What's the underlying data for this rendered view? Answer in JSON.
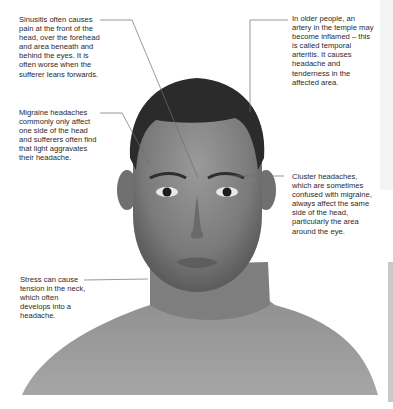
{
  "figure": {
    "colors": {
      "background": "#ffffff",
      "text": "#2a2a2a",
      "leader_line": "#6e6e6e",
      "skin_mid": "#8a8a8a",
      "hair": "#2b2b2b"
    }
  },
  "annotations": [
    {
      "id": "sinusitis",
      "text": "Sinusitis often causes pain at the front of the head, over the forehead and area beneath and behind the eyes. It is often worse when the sufferer leans forwards."
    },
    {
      "id": "temporal-arteritis",
      "text": "In older people, an artery in the temple may become inflamed – this is called temporal arteritis. It causes headache and tenderness in the affected area."
    },
    {
      "id": "migraine",
      "text": "Migraine headaches commonly only affect one side of the head and sufferers often find that light aggravates their headache."
    },
    {
      "id": "cluster",
      "text": "Cluster headaches, which are sometimes confused with migraine, always affect the same side of the head, particularly the area around the eye."
    },
    {
      "id": "stress",
      "text": "Stress can cause tension in the neck, which often develops into a headache."
    }
  ]
}
